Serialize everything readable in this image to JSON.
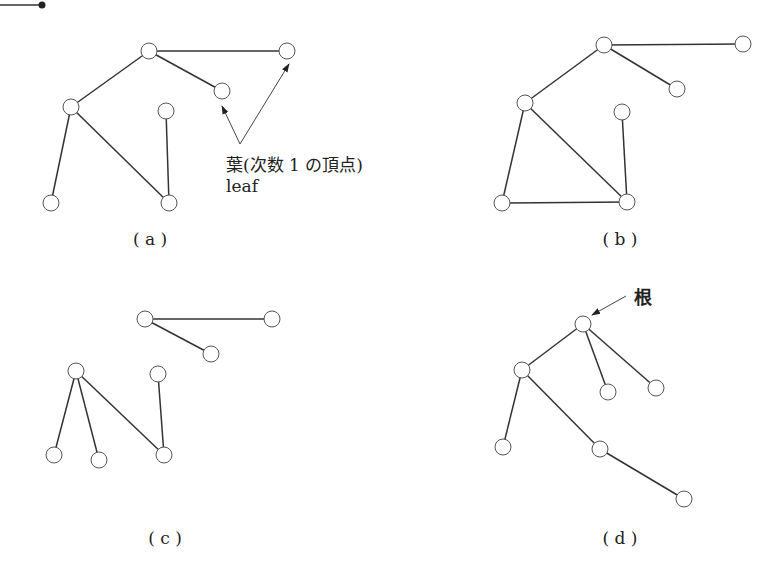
{
  "figure": {
    "corner_mark": {
      "x1": 0,
      "y1": 5,
      "x2": 42,
      "y2": 5,
      "dot_r": 3.5
    },
    "node_radius": 8,
    "panels": [
      {
        "id": "a",
        "caption": "( a )",
        "caption_pos": [
          150,
          245
        ],
        "nodes": [
          [
            149,
            51
          ],
          [
            287,
            51
          ],
          [
            222,
            91
          ],
          [
            71,
            107
          ],
          [
            166,
            111
          ],
          [
            51,
            203
          ],
          [
            169,
            203
          ]
        ],
        "edges": [
          [
            0,
            1
          ],
          [
            0,
            2
          ],
          [
            0,
            3
          ],
          [
            3,
            5
          ],
          [
            3,
            6
          ],
          [
            4,
            6
          ]
        ],
        "annotation": {
          "line1": "葉(次数 1 の頂点)",
          "line2": "leaf",
          "line1_pos": [
            226,
            171
          ],
          "line2_pos": [
            226,
            192
          ],
          "arrow_origin": [
            240,
            144
          ],
          "arrow_targets": [
            [
              222,
              106
            ],
            [
              289,
              64
            ]
          ]
        }
      },
      {
        "id": "b",
        "caption": "( b )",
        "caption_pos": [
          620,
          245
        ],
        "nodes": [
          [
            604,
            45
          ],
          [
            743,
            44
          ],
          [
            677,
            89
          ],
          [
            525,
            103
          ],
          [
            622,
            112
          ],
          [
            502,
            203
          ],
          [
            627,
            202
          ]
        ],
        "edges": [
          [
            0,
            1
          ],
          [
            0,
            2
          ],
          [
            0,
            3
          ],
          [
            3,
            5
          ],
          [
            3,
            6
          ],
          [
            4,
            6
          ],
          [
            5,
            6
          ]
        ]
      },
      {
        "id": "c",
        "caption": "( c )",
        "caption_pos": [
          165,
          544
        ],
        "nodes": [
          [
            145,
            319
          ],
          [
            272,
            319
          ],
          [
            211,
            354
          ],
          [
            76,
            371
          ],
          [
            158,
            374
          ],
          [
            54,
            455
          ],
          [
            99,
            460
          ],
          [
            164,
            455
          ]
        ],
        "edges": [
          [
            0,
            1
          ],
          [
            0,
            2
          ],
          [
            3,
            5
          ],
          [
            3,
            6
          ],
          [
            3,
            7
          ],
          [
            4,
            7
          ]
        ]
      },
      {
        "id": "d",
        "caption": "( d )",
        "caption_pos": [
          620,
          544
        ],
        "nodes": [
          [
            583,
            324
          ],
          [
            522,
            370
          ],
          [
            608,
            392
          ],
          [
            656,
            388
          ],
          [
            503,
            447
          ],
          [
            600,
            449
          ],
          [
            684,
            499
          ]
        ],
        "edges": [
          [
            0,
            1
          ],
          [
            0,
            2
          ],
          [
            0,
            3
          ],
          [
            1,
            4
          ],
          [
            1,
            5
          ],
          [
            5,
            6
          ]
        ],
        "root_annotation": {
          "label": "根",
          "label_pos": [
            634,
            304
          ],
          "arrow_from": [
            626,
            296
          ],
          "arrow_to": [
            592,
            315
          ]
        }
      }
    ]
  }
}
